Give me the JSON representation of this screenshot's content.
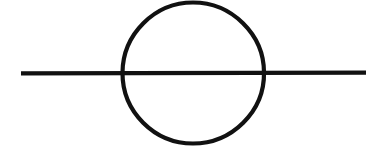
{
  "figure": {
    "background_color": "#ffffff",
    "stroke_color": "#111111",
    "canvas": {
      "width": 384,
      "height": 147
    },
    "elements": {
      "circle": {
        "name": "circle-outline",
        "center_x": 193,
        "center_y": 73,
        "radius": 70,
        "stroke_width": 4.2
      },
      "horizontal_line": {
        "name": "horizontal-diameter-line",
        "x_start": 21,
        "x_end": 366,
        "y": 73,
        "stroke_width": 4.2
      }
    },
    "labels": {
      "figure_label": "",
      "caption": ""
    }
  }
}
